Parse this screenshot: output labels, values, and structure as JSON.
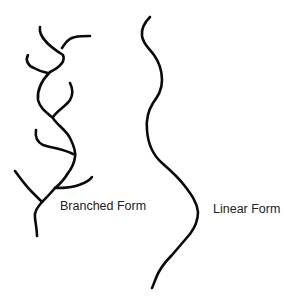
{
  "diagram": {
    "branched": {
      "label": "Branched Form"
    },
    "linear": {
      "label": "Linear Form"
    },
    "stroke_color": "#0a0a0a",
    "background_color": "#ffffff",
    "text_color": "#222222"
  }
}
